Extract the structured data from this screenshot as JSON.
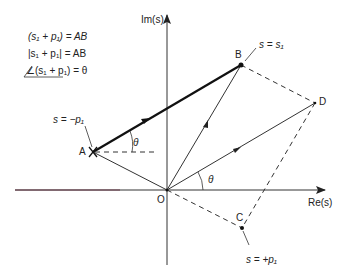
{
  "equations": [
    "(s₁ + p₁) = AB",
    "|s₁ + p₁| = AB",
    "∠(s₁ + p₁) = θ"
  ],
  "axes": {
    "imaginary_label": "Im(s)",
    "real_label": "Re(s)",
    "origin_label": "O"
  },
  "points": {
    "A": {
      "label": "A",
      "annotation": "s = −p₁"
    },
    "B": {
      "label": "B",
      "annotation": "s = s₁"
    },
    "C": {
      "label": "C",
      "annotation": "s = +p₁"
    },
    "D": {
      "label": "D"
    }
  },
  "angles": {
    "at_A": "θ",
    "at_O": "θ"
  },
  "colors": {
    "line": "#222222",
    "thick_line": "#111111",
    "real_axis_left": "#6a3a4a"
  }
}
